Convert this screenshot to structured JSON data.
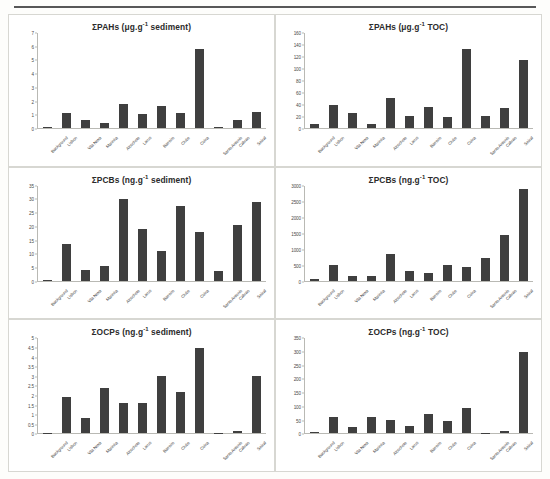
{
  "figure": {
    "categories": [
      "Background",
      "Lisbon",
      "Vila Nova",
      "Marinha",
      "Alcochete",
      "Larus",
      "Barreiro",
      "Clube",
      "Coina",
      "Santo Antonio",
      "Cabrao",
      "Seixal"
    ],
    "panels_order": [
      "pahs_sediment",
      "pahs_toc",
      "pcbs_sediment",
      "pcbs_toc",
      "ocps_sediment",
      "ocps_toc"
    ]
  },
  "chart_data": [
    {
      "id": "pahs_sediment",
      "type": "bar",
      "title": "ΣPAHs (μg.g⁻¹ sediment)",
      "title_main": "ΣPAHs (μg.g",
      "title_sup": "-1",
      "title_tail": " sediment)",
      "xlabel": "",
      "ylabel": "",
      "ylim": [
        0,
        7
      ],
      "yticks": [
        0,
        1,
        2,
        3,
        4,
        5,
        6,
        7
      ],
      "grid": false,
      "legend": "none",
      "categories": [
        "Background",
        "Lisbon",
        "Vila Nova",
        "Marinha",
        "Alcochete",
        "Larus",
        "Barreiro",
        "Clube",
        "Coina",
        "Santo Antonio",
        "Cabrao",
        "Seixal"
      ],
      "values": [
        0.03,
        1.1,
        0.6,
        0.35,
        1.8,
        1.05,
        1.6,
        1.1,
        5.8,
        0.05,
        0.6,
        1.2
      ]
    },
    {
      "id": "pahs_toc",
      "type": "bar",
      "title": "ΣPAHs (μg.g⁻¹ TOC)",
      "title_main": "ΣPAHs (μg.g",
      "title_sup": "-1",
      "title_tail": " TOC)",
      "xlabel": "",
      "ylabel": "",
      "ylim": [
        0,
        160
      ],
      "yticks": [
        0,
        20,
        40,
        60,
        80,
        100,
        120,
        140,
        160
      ],
      "grid": false,
      "legend": "none",
      "categories": [
        "Background",
        "Lisbon",
        "Vila Nova",
        "Marinha",
        "Alcochete",
        "Larus",
        "Barreiro",
        "Clube",
        "Coina",
        "Santo Antonio",
        "Cabrao",
        "Seixal"
      ],
      "values": [
        6,
        38,
        26,
        7,
        50,
        20,
        35,
        19,
        133,
        21,
        33,
        114
      ]
    },
    {
      "id": "pcbs_sediment",
      "type": "bar",
      "title": "ΣPCBs (ng.g⁻¹ sediment)",
      "title_main": "ΣPCBs (ng.g",
      "title_sup": "-1",
      "title_tail": " sediment)",
      "xlabel": "",
      "ylabel": "",
      "ylim": [
        0,
        35
      ],
      "yticks": [
        0,
        5,
        10,
        15,
        20,
        25,
        30,
        35
      ],
      "grid": false,
      "legend": "none",
      "categories": [
        "Background",
        "Lisbon",
        "Vila Nova",
        "Marinha",
        "Alcochete",
        "Larus",
        "Barreiro",
        "Clube",
        "Coina",
        "Santo Antonio",
        "Cabrao",
        "Seixal"
      ],
      "values": [
        0.4,
        13.5,
        4,
        5.5,
        30,
        19,
        11,
        27.5,
        18,
        3.5,
        20.5,
        29
      ]
    },
    {
      "id": "pcbs_toc",
      "type": "bar",
      "title": "ΣPCBs (ng.g⁻¹ TOC)",
      "title_main": "ΣPCBs (ng.g",
      "title_sup": "-1",
      "title_tail": " TOC)",
      "xlabel": "",
      "ylabel": "",
      "ylim": [
        0,
        3000
      ],
      "yticks": [
        0,
        500,
        1000,
        1500,
        2000,
        2500,
        3000
      ],
      "grid": false,
      "legend": "none",
      "categories": [
        "Background",
        "Lisbon",
        "Vila Nova",
        "Marinha",
        "Alcochete",
        "Larus",
        "Barreiro",
        "Clube",
        "Coina",
        "Santo Antonio",
        "Cabrao",
        "Seixal"
      ],
      "values": [
        60,
        500,
        150,
        160,
        850,
        300,
        230,
        500,
        430,
        720,
        1450,
        2900
      ]
    },
    {
      "id": "ocps_sediment",
      "type": "bar",
      "title": "ΣOCPs (ng.g⁻¹ sediment)",
      "title_main": "ΣOCPs (ng.g",
      "title_sup": "-1",
      "title_tail": " sediment)",
      "xlabel": "",
      "ylabel": "",
      "ylim": [
        0,
        5
      ],
      "yticks": [
        0,
        0.5,
        1,
        1.5,
        2,
        2.5,
        3,
        3.5,
        4,
        4.5,
        5
      ],
      "ytick_labels": [
        "0",
        "0.5",
        "1",
        "1.5",
        "2",
        "2.5",
        "3",
        "3.5",
        "4",
        "4.5",
        "5"
      ],
      "grid": false,
      "legend": "none",
      "categories": [
        "Background",
        "Lisbon",
        "Vila Nova",
        "Marinha",
        "Alcochete",
        "Larus",
        "Barreiro",
        "Clube",
        "Coina",
        "Santo Antonio",
        "Cabrao",
        "Seixal"
      ],
      "values": [
        0,
        1.9,
        0.8,
        2.4,
        1.6,
        1.6,
        3.0,
        2.2,
        4.5,
        0,
        0.1,
        3.0
      ]
    },
    {
      "id": "ocps_toc",
      "type": "bar",
      "title": "ΣOCPs (ng.g⁻¹ TOC)",
      "title_main": "ΣOCPs (ng.g",
      "title_sup": "-1",
      "title_tail": " TOC)",
      "xlabel": "",
      "ylabel": "",
      "ylim": [
        0,
        350
      ],
      "yticks": [
        0,
        50,
        100,
        150,
        200,
        250,
        300,
        350
      ],
      "grid": false,
      "legend": "none",
      "categories": [
        "Background",
        "Lisbon",
        "Vila Nova",
        "Marinha",
        "Alcochete",
        "Larus",
        "Barreiro",
        "Clube",
        "Coina",
        "Santo Antonio",
        "Cabrao",
        "Seixal"
      ],
      "values": [
        5,
        62,
        25,
        62,
        48,
        27,
        72,
        45,
        92,
        3,
        10,
        300
      ]
    }
  ],
  "style": {
    "bar_color": "#3f3f3f",
    "axis_color": "#b9b9b4",
    "text_color": "#2b2b2b",
    "panel_border": "#d7d7d2",
    "page_background": "#fdfdfb"
  }
}
